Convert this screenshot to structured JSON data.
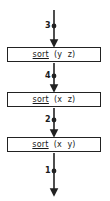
{
  "diagram": {
    "type": "pipeline-flow",
    "stages": [
      {
        "op": "sort",
        "args": "(y  z)"
      },
      {
        "op": "sort",
        "args": "(x  z)"
      },
      {
        "op": "sort",
        "args": "(x  y)"
      }
    ],
    "edges": [
      {
        "label": "3"
      },
      {
        "label": "4"
      },
      {
        "label": "2"
      },
      {
        "label": "1"
      }
    ],
    "colors": {
      "line": "#222222",
      "background": "#ffffff"
    }
  }
}
